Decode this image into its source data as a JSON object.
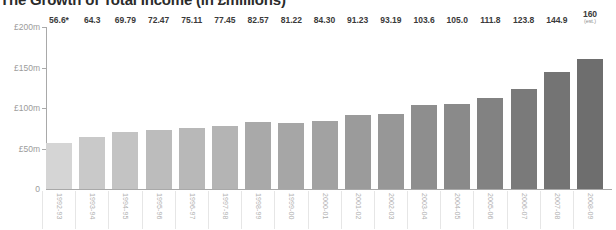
{
  "chart_data": {
    "type": "bar",
    "title": "The Growth of Total Income (in £millions)",
    "xlabel": "",
    "ylabel": "",
    "ylim": [
      0,
      200
    ],
    "grid": false,
    "legend": "none",
    "y_ticks": [
      "0",
      "£50m",
      "£100m",
      "£150m",
      "£200m"
    ],
    "y_tick_values": [
      0,
      50,
      100,
      150,
      200
    ],
    "categories": [
      "1992-93",
      "1993-94",
      "1994-95",
      "1995-96",
      "1996-97",
      "1997-98",
      "1998-99",
      "1999-00",
      "2000-01",
      "2001-02",
      "2002-03",
      "2003-04",
      "2004-05",
      "2005-06",
      "2006-07",
      "2007-08",
      "2008-09"
    ],
    "values": [
      56.6,
      64.3,
      69.79,
      72.47,
      75.11,
      77.45,
      82.57,
      81.22,
      84.3,
      91.23,
      93.19,
      103.6,
      105.0,
      111.8,
      123.8,
      144.9,
      160
    ],
    "data_labels": [
      "56.6*",
      "64.3",
      "69.79",
      "72.47",
      "75.11",
      "77.45",
      "82.57",
      "81.22",
      "84.30",
      "91.23",
      "93.19",
      "103.6",
      "105.0",
      "111.8",
      "123.8",
      "144.9",
      "160"
    ],
    "annotations": [
      {
        "category": "1992-93",
        "text": "*",
        "note": "asterisk footnote marker on first bar"
      },
      {
        "category": "2008-09",
        "text": "(est.)",
        "note": "estimated figure"
      }
    ],
    "bar_colors": [
      "#d5d5d5",
      "#c9c9c9",
      "#c3c3c3",
      "#bcbcbc",
      "#b8b8b8",
      "#b4b4b4",
      "#a9a9a9",
      "#a6a6a6",
      "#a2a2a2",
      "#9b9b9b",
      "#979797",
      "#8e8e8e",
      "#8a8a8a",
      "#828282",
      "#7a7a7a",
      "#747474",
      "#6e6e6e"
    ],
    "est_suffix": "(est.)",
    "axis_color": "#a9a9a9",
    "label_color": "#9b9b9b",
    "value_color": "#3a3a3a"
  }
}
